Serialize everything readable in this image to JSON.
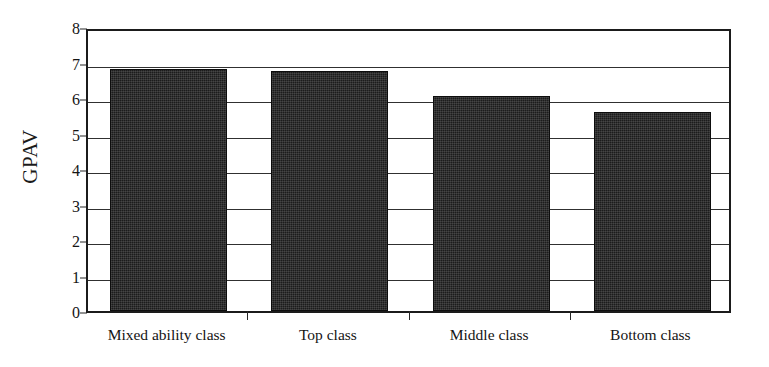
{
  "chart_data": {
    "type": "bar",
    "title": "",
    "subtitle": "",
    "xlabel": "",
    "ylabel": "GPAV",
    "categories": [
      "Mixed ability class",
      "Top class",
      "Middle class",
      "Bottom class"
    ],
    "values": [
      6.82,
      6.77,
      6.05,
      5.6
    ],
    "ylim": [
      0,
      8
    ],
    "ytick_labels": [
      "8",
      "7",
      "6",
      "5",
      "4",
      "3",
      "2",
      "1",
      "0"
    ],
    "ytick_values": [
      8,
      7,
      6,
      5,
      4,
      3,
      2,
      1,
      0
    ],
    "grid": true,
    "grid_axis": "y",
    "legend": false,
    "legend_position": "none",
    "bar_color": "#1c1c1c",
    "bar_edge_color": "#0d0d0d",
    "axis_color": "#1b1b1b",
    "grid_color": "#303030",
    "background_color": "#ffffff"
  }
}
